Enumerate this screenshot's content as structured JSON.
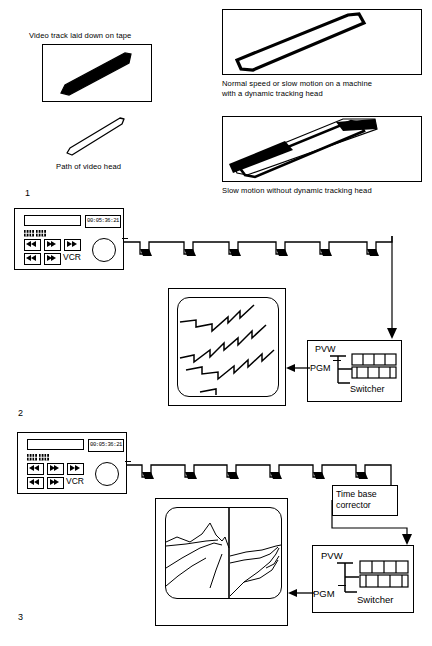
{
  "figure": {
    "title_caption_top_left": "Video track laid down on tape",
    "caption_video_head_path": "Path of video head",
    "caption_normal_speed": "Normal speed or slow motion on a machine\nwith a dynamic tracking head",
    "caption_slow_motion": "Slow motion without dynamic tracking head",
    "section_numbers": [
      "1",
      "2",
      "3"
    ]
  },
  "vcr_panel": {
    "device_label": "VCR",
    "timecode_display": "00:05:36:21",
    "counter_digits": "88:88",
    "transport_buttons_row1": [
      "rewind-button",
      "play-button",
      "fast-forward-button"
    ],
    "transport_buttons_row2": [
      "record-button",
      "pause-button"
    ],
    "jog_dial": "jog-shuttle-dial"
  },
  "switcher": {
    "name": "Switcher",
    "preview_label": "PVW",
    "program_label": "PGM",
    "bus_rows": 2,
    "bus_buttons_per_row": 4
  },
  "tbc": {
    "line1": "Time base",
    "line2": "corrector",
    "full_label": "Time base corrector"
  },
  "monitors": {
    "upper_monitor_content": "torn-zigzag-video-lines",
    "lower_monitor_content": "landscape-image-with-horizontal-shift-split"
  },
  "tape": {
    "track_count_section2": 6,
    "track_count_section3": 6,
    "track_mark": "video-head-track-mark"
  },
  "colors": {
    "ink": "#000000",
    "paper": "#ffffff"
  }
}
